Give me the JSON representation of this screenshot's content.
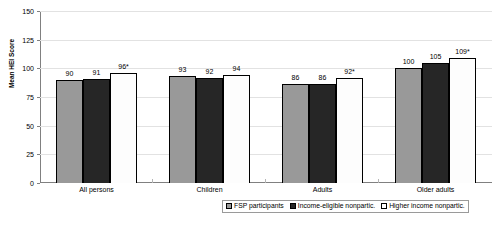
{
  "chart_data": {
    "type": "bar",
    "title": "",
    "xlabel": "",
    "ylabel": "Mean HEI Score",
    "ylim": [
      0,
      150
    ],
    "yticks": [
      150,
      125,
      100,
      75,
      50,
      25,
      0
    ],
    "grid": true,
    "legend_position": "bottom",
    "categories": [
      "All persons",
      "Children",
      "Adults",
      "Older adults"
    ],
    "series": [
      {
        "name": "FSP participants",
        "color": "#999999",
        "values": [
          90,
          91,
          86,
          100
        ],
        "labels": [
          "90",
          "91",
          "86",
          "100"
        ]
      },
      {
        "name": "Income-eligible nonpartic.",
        "color": "#262626",
        "values": [
          91,
          92,
          86,
          105
        ],
        "labels": [
          "91",
          "92",
          "86",
          "105"
        ]
      },
      {
        "name": "Higher income nonpartic.",
        "color": "#ffffff",
        "values": [
          96,
          94,
          92,
          109
        ],
        "labels": [
          "96*",
          "94",
          "92*",
          "109*"
        ]
      }
    ]
  },
  "axis": {
    "y_title": "Mean HEI Score",
    "ticks": [
      "150",
      "125",
      "100",
      "75",
      "50",
      "25",
      "0"
    ]
  },
  "categories": [
    {
      "label": "All persons"
    },
    {
      "label": "Children"
    },
    {
      "label": "Adults"
    },
    {
      "label": "Older adults"
    }
  ],
  "legend": [
    {
      "label": "FSP participants"
    },
    {
      "label": "Income-eligible nonpartic."
    },
    {
      "label": "Higher income nonpartic."
    }
  ],
  "bars": {
    "g0": [
      {
        "value": 90,
        "label": "90"
      },
      {
        "value": 91,
        "label": "91"
      },
      {
        "value": 96,
        "label": "96*"
      }
    ],
    "g1": [
      {
        "value": 93,
        "label": "93"
      },
      {
        "value": 92,
        "label": "92"
      },
      {
        "value": 94,
        "label": "94"
      }
    ],
    "g2": [
      {
        "value": 86,
        "label": "86"
      },
      {
        "value": 86,
        "label": "86"
      },
      {
        "value": 92,
        "label": "92*"
      }
    ],
    "g3": [
      {
        "value": 100,
        "label": "100"
      },
      {
        "value": 105,
        "label": "105"
      },
      {
        "value": 109,
        "label": "109*"
      }
    ]
  },
  "colors": {
    "series_0": "#999999",
    "series_1": "#262626",
    "series_2": "#ffffff",
    "axis": "#808080",
    "grid": "#e2e2e2",
    "text": "#000000"
  }
}
